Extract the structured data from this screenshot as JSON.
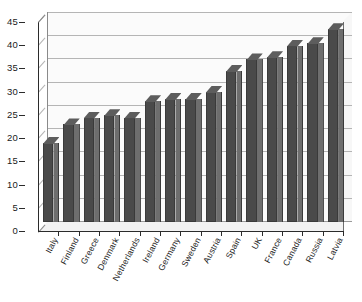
{
  "chart_data": {
    "type": "bar",
    "title": "",
    "subtitle": "",
    "xlabel": "",
    "ylabel": "",
    "ylim": [
      0,
      45
    ],
    "ytick_step": 5,
    "yticks": [
      "45",
      "40",
      "35",
      "30",
      "25",
      "20",
      "15",
      "10",
      "5",
      "0"
    ],
    "grid": true,
    "legend": "none",
    "style": "3d-column",
    "categories": [
      "Italy",
      "Finland",
      "Greece",
      "Denmark",
      "Netherlands",
      "Ireland",
      "Germany",
      "Sweden",
      "Austria",
      "Spain",
      "UK",
      "France",
      "Canada",
      "Russia",
      "Latvia"
    ],
    "values": [
      17,
      21,
      22.5,
      23,
      22.5,
      26,
      26.5,
      26.5,
      28,
      32.5,
      35,
      35.5,
      38,
      38.5,
      41.5
    ],
    "series": [
      {
        "name": "",
        "values": [
          17,
          21,
          22.5,
          23,
          22.5,
          26,
          26.5,
          26.5,
          28,
          32.5,
          35,
          35.5,
          38,
          38.5,
          41.5
        ]
      }
    ],
    "colors": {
      "bar_front": "#4a4a4a",
      "bar_side": "#6e6e6e",
      "bar_top": "#5d5d5d",
      "gridline": "#b5b5b5",
      "axis": "#2b2b2b",
      "plot_background": "#fbfbfb",
      "page_background": "#ffffff"
    }
  }
}
